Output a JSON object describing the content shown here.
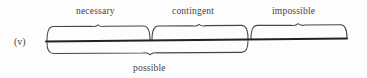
{
  "figure": {
    "enumeration_label": "(v)",
    "diagram_type": "modal-logic-spectrum-bracket-diagram",
    "background_color": "#fdfdfd",
    "ink_color": "#2e2e2e"
  },
  "top_segments": [
    {
      "id": "necessary",
      "label": "necessary",
      "x_start": 47,
      "x_end": 150,
      "tick_x": 98
    },
    {
      "id": "contingent",
      "label": "contingent",
      "x_start": 152,
      "x_end": 248,
      "tick_x": 199
    },
    {
      "id": "impossible",
      "label": "impossible",
      "x_start": 251,
      "x_end": 347,
      "tick_x": 298
    }
  ],
  "bottom_segments": [
    {
      "id": "possible",
      "label": "possible",
      "x_start": 47,
      "x_end": 248,
      "tick_x": 150
    }
  ],
  "axis": {
    "label": "main-horizontal-line",
    "x_start": 46,
    "x_end": 347,
    "y_left": 41.5,
    "y_right": 38.5
  },
  "labels": {
    "necessary": "necessary",
    "contingent": "contingent",
    "impossible": "impossible",
    "possible": "possible"
  }
}
